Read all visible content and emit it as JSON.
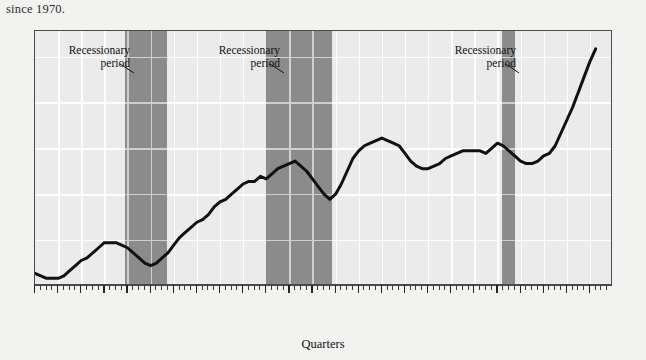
{
  "caption": "since 1970.",
  "axis": {
    "xlabel": "Quarters"
  },
  "annotations": [
    {
      "id": "rec1",
      "line1": "Recessionary",
      "line2": "period"
    },
    {
      "id": "rec2",
      "line1": "Recessionary",
      "line2": "period"
    },
    {
      "id": "rec3",
      "line1": "Recessionary",
      "line2": "period"
    }
  ],
  "quarter_marks": [
    "I",
    "II",
    "III",
    "IV"
  ],
  "colors": {
    "page_background": "#f2f2f0",
    "plot_background": "#ebebeb",
    "gridline": "#ffffff",
    "recession_band": "#8b8b8b",
    "curve": "#111111",
    "frame": "#4a4a4a",
    "text": "#111111"
  },
  "chart_data": {
    "type": "line",
    "title": "",
    "xlabel": "Quarters",
    "ylabel": "",
    "grid": true,
    "legend": false,
    "x_tick_labels": [
      "1970",
      "1971",
      "1972",
      "1973",
      "1974",
      "1975",
      "1976",
      "1977",
      "1978",
      "1979",
      "1980",
      "1981",
      "1982",
      "1983",
      "1984",
      "1985",
      "1986",
      "1987",
      "1988",
      "1989",
      "1990",
      "1991",
      "1992",
      "1993",
      "1994"
    ],
    "x_minor_ticks_per_year": 4,
    "xlim": [
      1970,
      1995
    ],
    "ylim": [
      0,
      100
    ],
    "y_gridlines": [
      18,
      36,
      54,
      72,
      90
    ],
    "series": [
      {
        "name": "Index",
        "x": [
          1970.0,
          1970.25,
          1970.5,
          1970.75,
          1971.0,
          1971.25,
          1971.5,
          1971.75,
          1972.0,
          1972.25,
          1972.5,
          1972.75,
          1973.0,
          1973.25,
          1973.5,
          1973.75,
          1974.0,
          1974.25,
          1974.5,
          1974.75,
          1975.0,
          1975.25,
          1975.5,
          1975.75,
          1976.0,
          1976.25,
          1976.5,
          1976.75,
          1977.0,
          1977.25,
          1977.5,
          1977.75,
          1978.0,
          1978.25,
          1978.5,
          1978.75,
          1979.0,
          1979.25,
          1979.5,
          1979.75,
          1980.0,
          1980.25,
          1980.5,
          1980.75,
          1981.0,
          1981.25,
          1981.5,
          1981.75,
          1982.0,
          1982.25,
          1982.5,
          1982.75,
          1983.0,
          1983.25,
          1983.5,
          1983.75,
          1984.0,
          1984.25,
          1984.5,
          1984.75,
          1985.0,
          1985.25,
          1985.5,
          1985.75,
          1986.0,
          1986.25,
          1986.5,
          1986.75,
          1987.0,
          1987.25,
          1987.5,
          1987.75,
          1988.0,
          1988.25,
          1988.5,
          1988.75,
          1989.0,
          1989.25,
          1989.5,
          1989.75,
          1990.0,
          1990.25,
          1990.5,
          1990.75,
          1991.0,
          1991.25,
          1991.5,
          1991.75,
          1992.0,
          1992.25,
          1992.5,
          1992.75,
          1993.0,
          1993.25,
          1993.5,
          1993.75,
          1994.0,
          1994.25
        ],
        "y": [
          5,
          4,
          3,
          3,
          3,
          4,
          6,
          8,
          10,
          11,
          13,
          15,
          17,
          17,
          17,
          16,
          15,
          13,
          11,
          9,
          8,
          9,
          11,
          13,
          16,
          19,
          21,
          23,
          25,
          26,
          28,
          31,
          33,
          34,
          36,
          38,
          40,
          41,
          41,
          43,
          42,
          44,
          46,
          47,
          48,
          49,
          47,
          45,
          42,
          39,
          36,
          34,
          36,
          40,
          45,
          50,
          53,
          55,
          56,
          57,
          58,
          57,
          56,
          55,
          52,
          49,
          47,
          46,
          46,
          47,
          48,
          50,
          51,
          52,
          53,
          53,
          53,
          53,
          52,
          54,
          56,
          55,
          53,
          51,
          49,
          48,
          48,
          49,
          51,
          52,
          55,
          60,
          65,
          70,
          76,
          82,
          88,
          93
        ]
      }
    ],
    "recession_bands": [
      {
        "start": 1973.9,
        "end": 1975.7,
        "label": "Recessionary period"
      },
      {
        "start": 1980.0,
        "end": 1982.85,
        "label": "Recessionary period"
      },
      {
        "start": 1990.2,
        "end": 1990.75,
        "label": "Recessionary period"
      }
    ]
  }
}
